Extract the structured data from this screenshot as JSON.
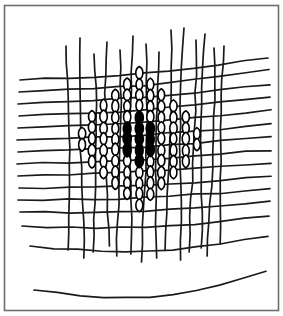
{
  "figure": {
    "title": "Woven mesh fabric with central knitted diamond region",
    "kind": "line-drawing",
    "canvas": {
      "width": 283,
      "height": 316,
      "background": "#ffffff"
    },
    "frame": {
      "name": "image-border",
      "x": 4.5,
      "y": 5.5,
      "width": 274,
      "height": 305,
      "stroke": "#6e6e6e",
      "stroke_width": 1.6,
      "fill": "none"
    },
    "style": {
      "thread_stroke": "#1a1a1a",
      "thread_width": 1.7,
      "loop_stroke": "#000000",
      "loop_width": 1.6,
      "fill_black": "#000000",
      "fill_white": "#ffffff"
    },
    "warp": {
      "label": "vertical threads",
      "count": 14,
      "top_y": [
        46,
        38,
        54,
        42,
        50,
        36,
        44,
        52,
        30,
        28,
        40,
        34,
        48,
        46
      ],
      "bottom_y": [
        250,
        258,
        252,
        246,
        256,
        254,
        262,
        258,
        250,
        260,
        252,
        248,
        256,
        244
      ],
      "x_top": [
        66,
        80,
        94,
        107,
        120,
        133,
        146,
        159,
        171,
        184,
        196,
        205,
        214,
        224
      ],
      "x_bottom": [
        70,
        83,
        95,
        107,
        118,
        130,
        143,
        155,
        167,
        179,
        190,
        200,
        209,
        219
      ],
      "wobble": [
        1.6,
        -1.2,
        2.0,
        -1.8,
        1.4,
        -1.5,
        1.9,
        -1.1,
        1.7,
        -2.0,
        1.3,
        -1.6,
        1.8,
        -1.3
      ]
    },
    "weft": {
      "label": "horizontal threads",
      "count": 15,
      "left_x": [
        20,
        19,
        18,
        19,
        18,
        17,
        18,
        17,
        18,
        19,
        18,
        20,
        22,
        30,
        34
      ],
      "right_x": [
        268,
        269,
        270,
        270,
        271,
        271,
        271,
        271,
        271,
        271,
        270,
        270,
        269,
        268,
        266
      ],
      "y_left": [
        80,
        92,
        104,
        116,
        128,
        140,
        152,
        164,
        176,
        188,
        200,
        212,
        226,
        246,
        290
      ],
      "y_right": [
        58,
        70,
        84,
        97,
        110,
        124,
        137,
        150,
        163,
        176,
        189,
        202,
        216,
        236,
        272
      ],
      "sag": [
        4,
        4,
        3,
        3,
        3,
        3,
        2,
        2,
        2,
        3,
        3,
        4,
        6,
        10,
        16
      ]
    },
    "knit_region": {
      "label": "knitted diamond of loop stitches",
      "shape": "diamond",
      "center_x": 139,
      "center_y": 139,
      "half_width": 72,
      "half_height": 70,
      "column_count": 13,
      "column_spacing": 11.6,
      "loop_height": 11.0,
      "loop_width": 9.4
    },
    "black_core": {
      "label": "filled black diamond core",
      "shape": "diamond",
      "center_x": 138,
      "center_y": 139,
      "half_width": 22,
      "half_height": 25,
      "column_count": 4,
      "fill": "#000000"
    }
  }
}
